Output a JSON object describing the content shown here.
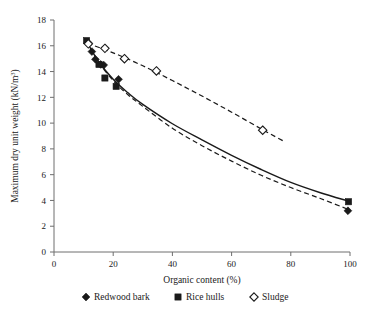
{
  "chart_data": {
    "type": "scatter",
    "title": "",
    "xlabel": "Organic content (%)",
    "ylabel": "Maximum dry unit weight (kN/m",
    "ylabel_superscript": "3",
    "ylabel_suffix": ")",
    "ylabel_full": "Maximum dry unit weight (kN/m3)",
    "xlim": [
      0,
      100
    ],
    "ylim": [
      0,
      18
    ],
    "xticks": [
      "0",
      "20",
      "40",
      "60",
      "80",
      "100"
    ],
    "xtick_values": [
      0,
      20,
      40,
      60,
      80,
      100
    ],
    "yticks": [
      "0",
      "2",
      "4",
      "6",
      "8",
      "10",
      "12",
      "14",
      "16",
      "18"
    ],
    "ytick_values": [
      0,
      2,
      4,
      6,
      8,
      10,
      12,
      14,
      16,
      18
    ],
    "grid": false,
    "legend_position": "bottom",
    "series": [
      {
        "name": "Redwood bark",
        "marker": "filled-diamond",
        "line": "solid",
        "color": "#1a1a1a",
        "points": [
          [
            11.5,
            16.25
          ],
          [
            12.8,
            15.55
          ],
          [
            14.0,
            14.95
          ],
          [
            15.8,
            14.55
          ],
          [
            16.8,
            14.5
          ],
          [
            21.8,
            13.4
          ],
          [
            99.3,
            3.2
          ]
        ]
      },
      {
        "name": "Rice hulls",
        "marker": "filled-square",
        "line": "dashed",
        "color": "#1a1a1a",
        "points": [
          [
            11.0,
            16.4
          ],
          [
            15.2,
            14.55
          ],
          [
            17.2,
            13.5
          ],
          [
            21.0,
            12.85
          ],
          [
            99.5,
            3.9
          ]
        ]
      },
      {
        "name": "Sludge",
        "marker": "open-diamond",
        "line": "dashed",
        "color": "#ffffff",
        "points": [
          [
            11.6,
            16.15
          ],
          [
            17.2,
            15.8
          ],
          [
            23.8,
            15.0
          ],
          [
            34.6,
            14.05
          ],
          [
            70.5,
            9.45
          ]
        ]
      }
    ],
    "fitted_curves": [
      {
        "name": "Redwood bark fit",
        "line": "solid",
        "points": [
          [
            11.0,
            16.35
          ],
          [
            15.0,
            14.8
          ],
          [
            20.0,
            13.4
          ],
          [
            25.0,
            12.35
          ],
          [
            30.0,
            11.45
          ],
          [
            40.0,
            9.95
          ],
          [
            50.0,
            8.7
          ],
          [
            60.0,
            7.5
          ],
          [
            70.0,
            6.4
          ],
          [
            80.0,
            5.4
          ],
          [
            90.0,
            4.6
          ],
          [
            99.5,
            3.95
          ]
        ]
      },
      {
        "name": "Rice hulls fit",
        "line": "dashed",
        "points": [
          [
            11.0,
            16.35
          ],
          [
            15.0,
            14.75
          ],
          [
            20.0,
            13.3
          ],
          [
            25.0,
            12.2
          ],
          [
            30.0,
            11.3
          ],
          [
            40.0,
            9.6
          ],
          [
            50.0,
            8.25
          ],
          [
            60.0,
            7.05
          ],
          [
            70.0,
            5.95
          ],
          [
            80.0,
            5.0
          ],
          [
            90.0,
            4.15
          ],
          [
            99.5,
            3.3
          ]
        ]
      },
      {
        "name": "Sludge fit",
        "line": "dashed",
        "points": [
          [
            11.3,
            16.2
          ],
          [
            20.0,
            15.45
          ],
          [
            30.0,
            14.45
          ],
          [
            40.0,
            13.3
          ],
          [
            50.0,
            12.1
          ],
          [
            60.0,
            10.85
          ],
          [
            70.0,
            9.55
          ],
          [
            78.0,
            8.55
          ]
        ]
      }
    ]
  },
  "legend": {
    "items": [
      {
        "label": "Redwood bark",
        "marker": "filled-diamond"
      },
      {
        "label": "Rice hulls",
        "marker": "filled-square"
      },
      {
        "label": "Sludge",
        "marker": "open-diamond"
      }
    ]
  }
}
